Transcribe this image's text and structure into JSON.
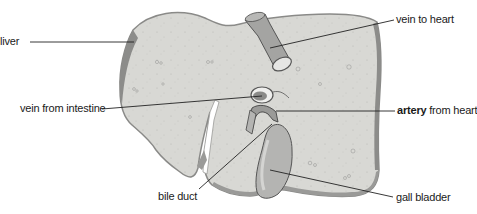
{
  "diagram": {
    "labels": {
      "liver": "liver",
      "vein_to_heart": "vein to heart",
      "vein_from_intestine": "vein from intestine",
      "artery_bold": "artery",
      "artery_rest": " from heart",
      "bile_duct": "bile duct",
      "gall_bladder": "gall bladder"
    },
    "colors": {
      "liver_fill": "#d6d6d2",
      "liver_edge": "#7a7a78",
      "vessel_fill": "#a8a8a6",
      "gall_bladder_fill": "#b4b4b2",
      "leader_line": "#222222",
      "text": "#1a1a1a"
    }
  }
}
